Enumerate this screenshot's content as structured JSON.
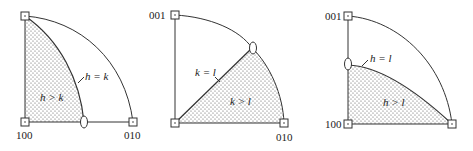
{
  "figure": {
    "panels": [
      {
        "id": "panel-1",
        "pole_labels": {
          "bottom_left": "100",
          "bottom_right": "010"
        },
        "boundary_label": "h = k",
        "region_label": "h > k",
        "shaded_region": "between left edge and h = k curve"
      },
      {
        "id": "panel-2",
        "pole_labels": {
          "top_left": "001",
          "bottom_right": "010"
        },
        "boundary_label": "k = l",
        "region_label": "k > l",
        "shaded_region": "below k = l line, right of it"
      },
      {
        "id": "panel-3",
        "pole_labels": {
          "top_left": "001",
          "bottom_left": "100"
        },
        "boundary_label": "h = l",
        "region_label": "h > l",
        "shaded_region": "below h = l curve"
      }
    ],
    "colors": {
      "line": "#333333",
      "shading_dots": "#555555",
      "background": "#ffffff"
    }
  }
}
